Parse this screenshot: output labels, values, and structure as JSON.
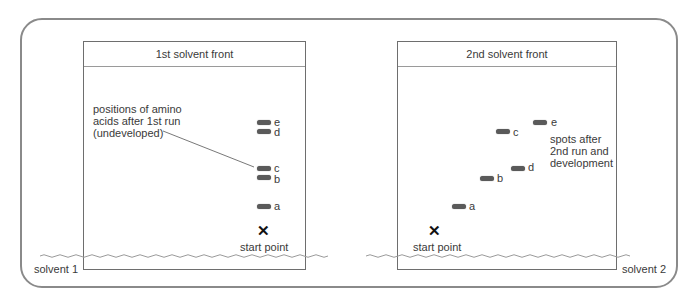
{
  "diagram": {
    "left_plate": {
      "front_label": "1st solvent front",
      "annotation": [
        "positions of amino",
        "acids after 1st run",
        "(undeveloped)"
      ],
      "spots": [
        {
          "label": "e",
          "x": 257,
          "y": 120
        },
        {
          "label": "d",
          "x": 257,
          "y": 129
        },
        {
          "label": "c",
          "x": 257,
          "y": 166
        },
        {
          "label": "b",
          "x": 257,
          "y": 175
        },
        {
          "label": "a",
          "x": 257,
          "y": 204
        }
      ],
      "start_label": "start point",
      "solvent_label": "solvent 1"
    },
    "right_plate": {
      "front_label": "2nd solvent front",
      "annotation": [
        "spots after",
        "2nd run and",
        "development"
      ],
      "spots": [
        {
          "label": "e",
          "x": 533,
          "y": 120
        },
        {
          "label": "c",
          "x": 496,
          "y": 129
        },
        {
          "label": "d",
          "x": 511,
          "y": 166
        },
        {
          "label": "b",
          "x": 480,
          "y": 176
        },
        {
          "label": "a",
          "x": 452,
          "y": 204
        }
      ],
      "start_label": "start point",
      "solvent_label": "solvent 2"
    },
    "mark_symbol": "✕",
    "colors": {
      "border": "#8a8a8a",
      "plate": "#6e6e6e",
      "spot": "#5a5a5a",
      "text": "#3a3a3a"
    }
  }
}
